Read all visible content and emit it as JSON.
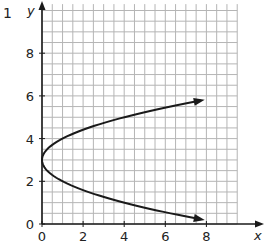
{
  "question_number": "1",
  "chart_data": {
    "type": "line",
    "title": "",
    "xlabel": "x",
    "ylabel": "y",
    "xlim": [
      0,
      9.5
    ],
    "ylim": [
      0,
      10.3
    ],
    "x_ticks": [
      0,
      2,
      4,
      6,
      8
    ],
    "y_ticks": [
      0,
      2,
      4,
      6,
      8
    ],
    "x_tick_labels": [
      "0",
      "2",
      "4",
      "6",
      "8"
    ],
    "y_tick_labels": [
      "0",
      "2",
      "4",
      "6",
      "8"
    ],
    "grid": true,
    "grid_step": 0.5,
    "series": [
      {
        "name": "x = (y - 3)^2",
        "equation": "x = (y - 3)^2",
        "vertex": [
          0,
          3
        ],
        "arrows": [
          "upper-right",
          "lower-right"
        ],
        "x": [
          7.7,
          4.0,
          2.25,
          1.0,
          0.25,
          0,
          0.25,
          1.0,
          2.25,
          4.0,
          6.25,
          7.7
        ],
        "y": [
          0.22,
          1.0,
          1.5,
          2.0,
          2.5,
          3.0,
          3.5,
          4.0,
          4.5,
          5.0,
          5.5,
          5.78
        ]
      }
    ],
    "legend": null
  }
}
